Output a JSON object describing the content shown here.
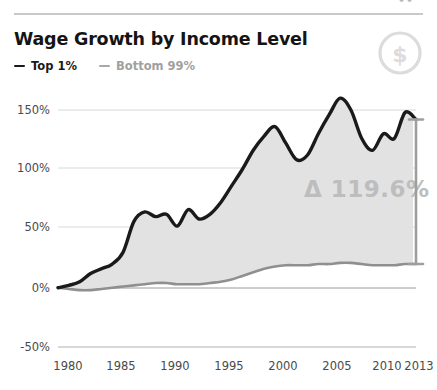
{
  "header": {
    "title": "Wage Growth by Income Level",
    "top_cut_text": "••",
    "badge_icon": "dollar-circle-icon",
    "badge_glyph": "$"
  },
  "legend": {
    "items": [
      {
        "label": "Top 1%",
        "color": "#1a1a1a"
      },
      {
        "label": "Bottom 99%",
        "color": "#a0a0a0"
      }
    ]
  },
  "annotation": {
    "delta_label": "Δ 119.6%",
    "bracket_icon": "range-bracket-icon"
  },
  "colors": {
    "top_series": "#1a1a1a",
    "bottom_series": "#8f8f8f",
    "fill": "#e0e0e0",
    "grid": "#d8d8d8",
    "axis_text": "#4a4a4a",
    "annotation": "#bdbdbd",
    "rule": "#c9c9c9"
  },
  "chart_data": {
    "type": "area",
    "title": "Wage Growth by Income Level",
    "xlabel": "",
    "ylabel": "",
    "xlim": [
      1980,
      2013
    ],
    "ylim": [
      -50,
      175
    ],
    "yticks": [
      150,
      100,
      50,
      0,
      -50
    ],
    "ytick_labels": [
      "150%",
      "100%",
      "50%",
      "0%",
      "-50%"
    ],
    "xticks": [
      1980,
      1985,
      1990,
      1995,
      2000,
      2005,
      2010,
      2013
    ],
    "xtick_labels": [
      "1980",
      "1985",
      "1990",
      "1995",
      "2000",
      "2005",
      "2010",
      "2013"
    ],
    "grid": true,
    "legend_position": "top-left",
    "annotations": [
      {
        "text": "Δ 119.6%",
        "x": 2006,
        "y": 72
      }
    ],
    "x": [
      1980,
      1981,
      1982,
      1983,
      1984,
      1985,
      1986,
      1987,
      1988,
      1989,
      1990,
      1991,
      1992,
      1993,
      1994,
      1995,
      1996,
      1997,
      1998,
      1999,
      2000,
      2001,
      2002,
      2003,
      2004,
      2005,
      2006,
      2007,
      2008,
      2009,
      2010,
      2011,
      2012,
      2013
    ],
    "series": [
      {
        "name": "Top 1%",
        "color": "#1a1a1a",
        "values": [
          0,
          2,
          5,
          12,
          16,
          20,
          30,
          56,
          64,
          60,
          62,
          52,
          66,
          58,
          62,
          72,
          86,
          100,
          116,
          128,
          136,
          122,
          108,
          112,
          130,
          146,
          160,
          150,
          126,
          116,
          130,
          126,
          148,
          142
        ]
      },
      {
        "name": "Bottom 99%",
        "color": "#8f8f8f",
        "values": [
          0,
          -1,
          -2,
          -2,
          -1,
          0,
          1,
          2,
          3,
          4,
          4,
          3,
          3,
          3,
          4,
          5,
          7,
          10,
          13,
          16,
          18,
          19,
          19,
          19,
          20,
          20,
          21,
          21,
          20,
          19,
          19,
          19,
          20,
          20
        ]
      }
    ],
    "delta_top_end": 142,
    "delta_bottom_end": 20,
    "delta_value": 119.6
  }
}
